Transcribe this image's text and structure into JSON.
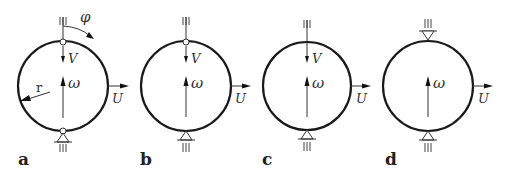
{
  "figure": {
    "panels": [
      {
        "id": "a",
        "label": "a",
        "cx": 63,
        "cy": 86,
        "r": 45,
        "top_support": "hinge",
        "bottom_support": "hinge-with-pin",
        "has_v": true,
        "has_phi": true,
        "has_r": true,
        "symbols": {
          "v": "V",
          "omega": "ω",
          "u": "U",
          "phi": "φ",
          "r": "r"
        }
      },
      {
        "id": "b",
        "label": "b",
        "cx": 186,
        "cy": 86,
        "r": 45,
        "top_support": "hinge",
        "bottom_support": "pin",
        "has_v": true,
        "symbols": {
          "v": "V",
          "omega": "ω",
          "u": "U"
        }
      },
      {
        "id": "c",
        "label": "c",
        "cx": 307,
        "cy": 86,
        "r": 44,
        "top_support": "rod-through",
        "bottom_support": "pin",
        "has_v": true,
        "symbols": {
          "v": "V",
          "omega": "ω",
          "u": "U"
        }
      },
      {
        "id": "d",
        "label": "d",
        "cx": 428,
        "cy": 86,
        "r": 45,
        "top_support": "pin-inverted",
        "bottom_support": "pin",
        "has_v": false,
        "symbols": {
          "omega": "ω",
          "u": "U"
        }
      }
    ],
    "colors": {
      "stroke": "#1a1a1a",
      "background": "#ffffff"
    }
  }
}
